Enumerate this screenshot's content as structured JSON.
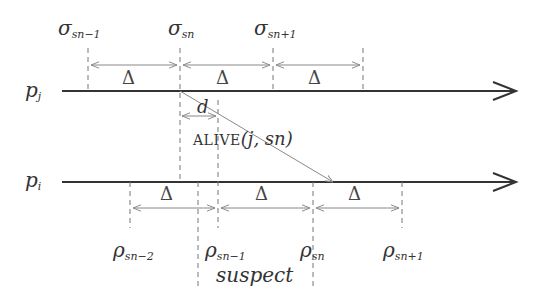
{
  "processes": {
    "pj": {
      "symbol": "p",
      "sub": "j"
    },
    "pi": {
      "symbol": "p",
      "sub": "i"
    }
  },
  "sigma_labels": [
    {
      "symbol": "σ",
      "sub": "sn−1"
    },
    {
      "symbol": "σ",
      "sub": "sn"
    },
    {
      "symbol": "σ",
      "sub": "sn+1"
    }
  ],
  "rho_labels": [
    {
      "symbol": "ρ",
      "sub": "sn−2"
    },
    {
      "symbol": "ρ",
      "sub": "sn−1"
    },
    {
      "symbol": "ρ",
      "sub": "sn"
    },
    {
      "symbol": "ρ",
      "sub": "sn+1"
    }
  ],
  "interval_label": "Δ",
  "delay_label": "d",
  "message_label": {
    "name": "ALIVE",
    "args": "(j, sn)"
  },
  "suspect_label": "suspect",
  "colors": {
    "axis": "#333333",
    "dash": "#777777",
    "arrow": "#888888",
    "text": "#333333"
  }
}
